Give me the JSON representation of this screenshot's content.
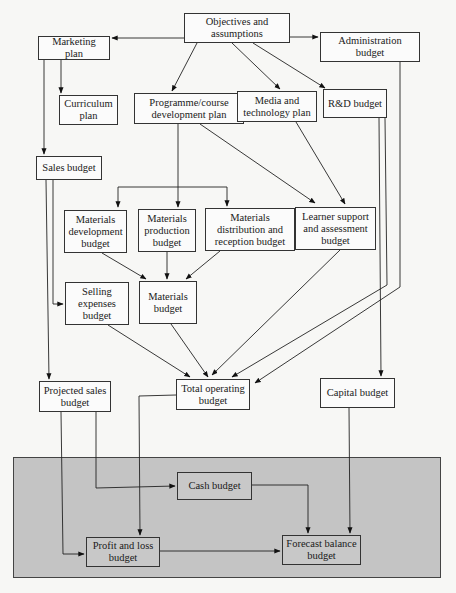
{
  "diagram": {
    "band": {
      "label": "",
      "color": "#c4c4c4"
    },
    "nodes": [
      {
        "id": "objectives",
        "label": "Objectives and\nassumptions",
        "x": 184,
        "y": 13,
        "w": 106,
        "h": 30
      },
      {
        "id": "marketing",
        "label": "Marketing plan",
        "x": 38,
        "y": 36,
        "w": 72,
        "h": 24
      },
      {
        "id": "administration",
        "label": "Administration\nbudget",
        "x": 320,
        "y": 32,
        "w": 100,
        "h": 30
      },
      {
        "id": "curriculum",
        "label": "Curriculum\nplan",
        "x": 59,
        "y": 95,
        "w": 59,
        "h": 30
      },
      {
        "id": "programme",
        "label": "Programme/course\ndevelopment plan",
        "x": 134,
        "y": 93,
        "w": 110,
        "h": 31
      },
      {
        "id": "media",
        "label": "Media and\ntechnology plan",
        "x": 237,
        "y": 91,
        "w": 80,
        "h": 31
      },
      {
        "id": "rd",
        "label": "R&D budget",
        "x": 323,
        "y": 89,
        "w": 64,
        "h": 29
      },
      {
        "id": "sales",
        "label": "Sales budget",
        "x": 36,
        "y": 156,
        "w": 66,
        "h": 24
      },
      {
        "id": "mat_dev",
        "label": "Materials\ndevelopment\nbudget",
        "x": 64,
        "y": 210,
        "w": 63,
        "h": 43
      },
      {
        "id": "mat_prod",
        "label": "Materials\nproduction\nbudget",
        "x": 138,
        "y": 209,
        "w": 58,
        "h": 43
      },
      {
        "id": "mat_dist",
        "label": "Materials\ndistribution and\nreception budget",
        "x": 205,
        "y": 208,
        "w": 90,
        "h": 43
      },
      {
        "id": "learner",
        "label": "Learner support\nand assessment\nbudget",
        "x": 295,
        "y": 207,
        "w": 81,
        "h": 43
      },
      {
        "id": "selling",
        "label": "Selling\nexpenses\nbudget",
        "x": 65,
        "y": 282,
        "w": 64,
        "h": 43
      },
      {
        "id": "materials",
        "label": "Materials\nbudget",
        "x": 139,
        "y": 281,
        "w": 58,
        "h": 43
      },
      {
        "id": "projected",
        "label": "Projected sales\nbudget",
        "x": 39,
        "y": 381,
        "w": 72,
        "h": 31
      },
      {
        "id": "total",
        "label": "Total operating\nbudget",
        "x": 176,
        "y": 379,
        "w": 74,
        "h": 31
      },
      {
        "id": "capital",
        "label": "Capital budget",
        "x": 320,
        "y": 378,
        "w": 75,
        "h": 30
      },
      {
        "id": "cash",
        "label": "Cash budget",
        "x": 177,
        "y": 472,
        "w": 75,
        "h": 28
      },
      {
        "id": "pnl",
        "label": "Profit and loss\nbudget",
        "x": 86,
        "y": 537,
        "w": 74,
        "h": 30
      },
      {
        "id": "forecast",
        "label": "Forecast balance\nbudget",
        "x": 282,
        "y": 535,
        "w": 79,
        "h": 30
      }
    ],
    "edges": [
      {
        "from": "objectives",
        "to": "marketing"
      },
      {
        "from": "objectives",
        "to": "administration"
      },
      {
        "from": "objectives",
        "to": "programme"
      },
      {
        "from": "objectives",
        "to": "media"
      },
      {
        "from": "objectives",
        "to": "rd"
      },
      {
        "from": "marketing",
        "to": "curriculum"
      },
      {
        "from": "marketing",
        "to": "sales"
      },
      {
        "from": "programme",
        "to": "mat_dev"
      },
      {
        "from": "programme",
        "to": "mat_prod"
      },
      {
        "from": "programme",
        "to": "mat_dist"
      },
      {
        "from": "programme",
        "to": "learner"
      },
      {
        "from": "media",
        "to": "learner"
      },
      {
        "from": "sales",
        "to": "selling"
      },
      {
        "from": "sales",
        "to": "projected"
      },
      {
        "from": "mat_dev",
        "to": "materials"
      },
      {
        "from": "mat_prod",
        "to": "materials"
      },
      {
        "from": "mat_dist",
        "to": "materials"
      },
      {
        "from": "selling",
        "to": "total"
      },
      {
        "from": "materials",
        "to": "total"
      },
      {
        "from": "learner",
        "to": "total"
      },
      {
        "from": "rd",
        "to": "total"
      },
      {
        "from": "administration",
        "to": "total"
      },
      {
        "from": "rd",
        "to": "capital"
      },
      {
        "from": "projected",
        "to": "cash"
      },
      {
        "from": "projected",
        "to": "pnl"
      },
      {
        "from": "total",
        "to": "pnl"
      },
      {
        "from": "cash",
        "to": "forecast"
      },
      {
        "from": "pnl",
        "to": "forecast"
      },
      {
        "from": "capital",
        "to": "forecast"
      }
    ]
  }
}
